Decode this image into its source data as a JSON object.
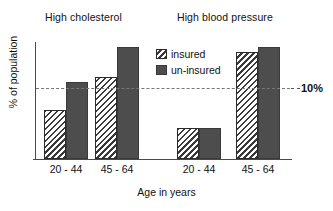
{
  "chart_data": {
    "type": "bar",
    "title": "",
    "xlabel": "Age in years",
    "ylabel": "% of population",
    "categories": [
      "20 - 44",
      "45 - 64",
      "20 - 44",
      "45 - 64"
    ],
    "group_titles": [
      "High cholesterol",
      "High blood pressure"
    ],
    "series": [
      {
        "name": "insured",
        "values": [
          7.0,
          11.6,
          4.4,
          15.2
        ]
      },
      {
        "name": "un-insured",
        "values": [
          10.9,
          15.9,
          4.4,
          15.9
        ]
      }
    ],
    "ylim": [
      0,
      16.6
    ],
    "grid": false,
    "legend_position": "inside-top-center",
    "annotations": [
      {
        "name": "reference-line",
        "value": 10,
        "label": "10%",
        "style": "dashed"
      }
    ],
    "colors": {
      "insured_fill": "#ffffff",
      "insured_hatch": "#3a3a3a",
      "uninsured_fill": "#4d4d4d",
      "axis": "#4a4a4a",
      "reference_line": "#777777",
      "text": "#111111"
    }
  },
  "titles": {
    "group_left": "High cholesterol",
    "group_right": "High blood pressure"
  },
  "axes": {
    "y_title": "% of population",
    "x_title": "Age in years",
    "ticks": [
      "20 - 44",
      "45 - 64",
      "20 - 44",
      "45 - 64"
    ]
  },
  "reference": {
    "label": "10%"
  },
  "legend": {
    "items": [
      {
        "label": "insured",
        "swatch": "hatched-swatch"
      },
      {
        "label": "un-insured",
        "swatch": "solid-dark-swatch"
      }
    ]
  }
}
